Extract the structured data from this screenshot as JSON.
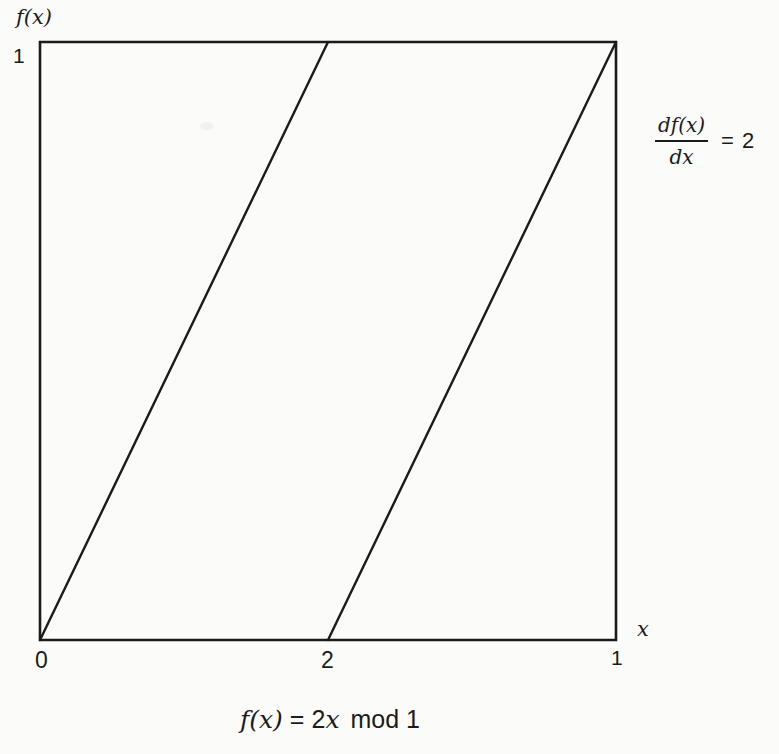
{
  "figure": {
    "background_color": "#fbfbfa",
    "ink_color": "#1b1b1b"
  },
  "axes": {
    "y_label": "f(x)",
    "x_label": "x"
  },
  "derivative_annotation": {
    "numerator": "df(x)",
    "denominator": "dx",
    "equals": "=",
    "value": "2"
  },
  "caption": {
    "f": "f(x)",
    "eq": "=",
    "coef": "2",
    "var": "x",
    "mod": "mod 1",
    "full_text": "f(x) = 2x mod 1"
  },
  "chart_data": {
    "type": "line",
    "xlabel": "x",
    "ylabel": "f(x)",
    "xlim": [
      0,
      1
    ],
    "ylim": [
      0,
      1
    ],
    "grid": false,
    "legend": false,
    "x_ticks": [
      {
        "pos": 0,
        "label": "0"
      },
      {
        "pos": 0.5,
        "label": "2"
      },
      {
        "pos": 1,
        "label": "1"
      }
    ],
    "y_ticks": [
      {
        "pos": 1,
        "label": "1"
      }
    ],
    "series": [
      {
        "name": "segment-1",
        "x": [
          0,
          0.5
        ],
        "y": [
          0,
          1
        ]
      },
      {
        "name": "segment-2",
        "x": [
          0.5,
          1
        ],
        "y": [
          0,
          1
        ]
      }
    ],
    "annotations": [
      "df(x)/dx = 2"
    ]
  }
}
